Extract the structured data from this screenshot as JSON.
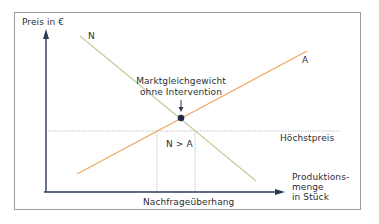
{
  "diagram": {
    "y_axis_label": "Preis in €",
    "x_axis_label_lines": [
      "Produktions-",
      "menge",
      "in Stück"
    ],
    "curves": [
      {
        "name": "demand",
        "label": "N",
        "color": "#c9cf9e"
      },
      {
        "name": "supply",
        "label": "A",
        "color": "#f0a860"
      }
    ],
    "equilibrium": {
      "label_line1": "Marktgleichgewicht",
      "label_line2": "ohne Intervention",
      "dot_color": "#1c2a44"
    },
    "price_ceiling_label": "Höchstpreis",
    "gap_label": "N > A",
    "shortage_label": "Nachfrageüberhang",
    "colors": {
      "axis": "#2d3b55",
      "frame": "#9a9ea3",
      "dotted": "#9aa0a6",
      "text": "#2b2f36"
    }
  }
}
